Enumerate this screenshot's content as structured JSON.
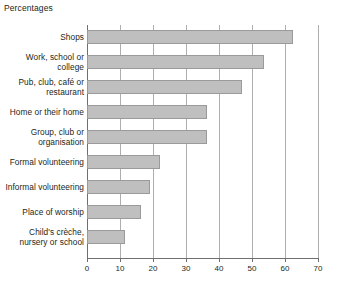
{
  "chart_data": {
    "type": "bar",
    "orientation": "horizontal",
    "title": "Percentages",
    "xlabel": "",
    "ylabel": "",
    "xlim": [
      0,
      70
    ],
    "xticks": [
      0,
      10,
      20,
      30,
      40,
      50,
      60,
      70
    ],
    "xtick_labels": [
      "0",
      "10",
      "20",
      "30",
      "40",
      "50",
      "60",
      "70"
    ],
    "grid": "vertical",
    "legend": "none",
    "bar_color": "#bfbfbf",
    "bar_border_color": "#9a9a9a",
    "axis_color": "#6f6f6f",
    "gridline_color": "#aeaeae",
    "categories": [
      "Shops",
      "Work, school or college",
      "Pub, club, café or restaurant",
      "Home or their home",
      "Group, club or organisation",
      "Formal volunteering",
      "Informal volunteering",
      "Place of worship",
      "Child's crèche, nursery or school"
    ],
    "values": [
      62.5,
      53.5,
      47,
      36.5,
      36.5,
      22,
      19,
      16.5,
      11.5
    ]
  }
}
